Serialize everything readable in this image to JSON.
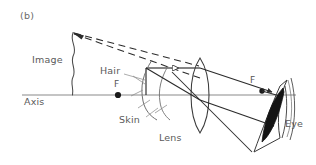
{
  "figure": {
    "panel_label": "(b)",
    "caption_labels": {
      "image": "Image",
      "hair": "Hair",
      "skin": "Skin",
      "axis": "Axis",
      "lens": "Lens",
      "eye": "Eye",
      "focal_left": "F",
      "focal_right": "F"
    },
    "colors": {
      "ink": "#2b2b2b",
      "label_gray": "#5a5a5a",
      "axis_gray": "#8a8a8a",
      "background": "#ffffff",
      "fill_dark": "#1a1a1a"
    },
    "geometry": {
      "axis_y": 95,
      "axis_x_start": 22,
      "axis_x_end": 296,
      "lens_center_x": 200,
      "lens_top_y": 58,
      "lens_bottom_y": 133,
      "focal_left_x": 118,
      "focal_right_x": 262,
      "object_x": 146,
      "object_top_y": 68,
      "virtual_image_x": 73,
      "virtual_image_top_y": 33,
      "eye_x": 283,
      "eye_top_y": 80,
      "eye_bottom_y": 140
    },
    "ray_types": {
      "solid": "real ray",
      "dashed": "virtual ray extension"
    }
  }
}
